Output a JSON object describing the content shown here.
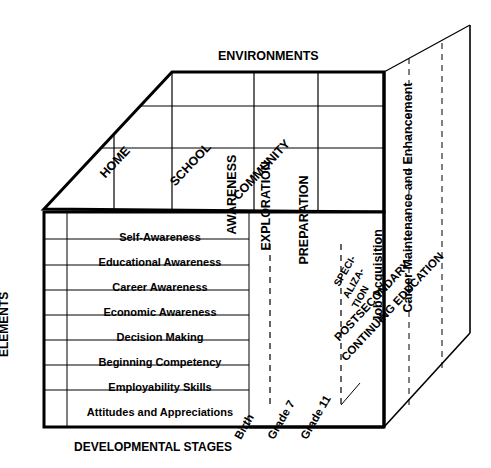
{
  "diagram": {
    "title_top": "ENVIRONMENTS",
    "title_bottom": "DEVELOPMENTAL STAGES",
    "axis_left": "ELEMENTS",
    "environments": [
      "HOME",
      "SCHOOL",
      "COMMUNITY"
    ],
    "phases": [
      "AWARENESS",
      "EXPLORATION",
      "PREPARATION"
    ],
    "elements": [
      "Self-Awareness",
      "Educational Awareness",
      "Career Awareness",
      "Economic Awareness",
      "Decision Making",
      "Beginning Competency",
      "Employability Skills",
      "Attitudes and Appreciations"
    ],
    "stages": [
      "Birth",
      "Grade 7",
      "Grade 11"
    ],
    "right_labels": [
      "Job Acquisition",
      "Career Maintenance and Enhancement"
    ],
    "spec_lines": [
      "SPECI-",
      "ALIZA-",
      "TION"
    ],
    "postsecondary": "POSTSECONDARY",
    "continuing": "CONTINUING EDUCATION",
    "colors": {
      "stroke": "#000000",
      "background": "#ffffff",
      "text": "#000000"
    }
  }
}
